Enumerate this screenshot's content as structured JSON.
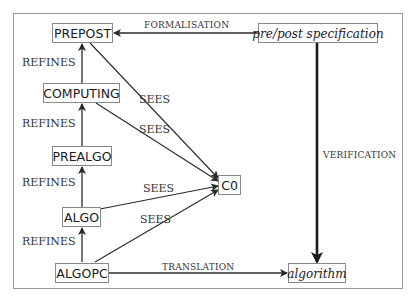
{
  "diagram": {
    "nodes": {
      "prepost": "PREPOST",
      "computing": "COMPUTING",
      "prealgo": "PREALGO",
      "algo": "ALGO",
      "algopc": "ALGOPC",
      "c0": "C0",
      "spec": "pre/post specification",
      "algorithm": "algorithm"
    },
    "edges": {
      "formalisation": "FORMALISATION",
      "verification": "VERIFICATION",
      "translation": "TRANSLATION",
      "refines_1": "REFINES",
      "refines_2": "REFINES",
      "refines_3": "REFINES",
      "refines_4": "REFINES",
      "sees_1": "SEES",
      "sees_2": "SEES",
      "sees_3": "SEES",
      "sees_4": "SEES"
    },
    "colors": {
      "line": "#2a2a2a",
      "box_border": "#888888",
      "frame": "#9a9a9a"
    }
  }
}
